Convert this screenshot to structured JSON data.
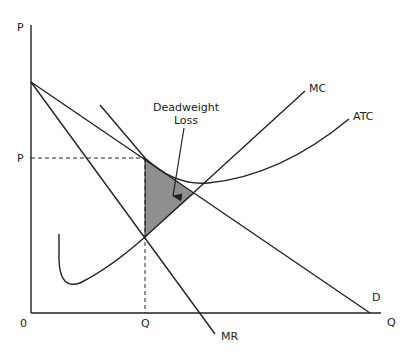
{
  "diagram": {
    "axes": {
      "y_label": "P",
      "x_label": "Q",
      "origin_label": "0",
      "price_tick_label": "P",
      "quantity_tick_label": "Q"
    },
    "curves": {
      "mc": "MC",
      "atc": "ATC",
      "demand": "D",
      "mr": "MR"
    },
    "annotation": {
      "line1": "Deadweight",
      "line2": "Loss"
    },
    "colors": {
      "line": "#222222",
      "deadweight_fill": "#8f8f8f",
      "background": "#ffffff"
    }
  }
}
